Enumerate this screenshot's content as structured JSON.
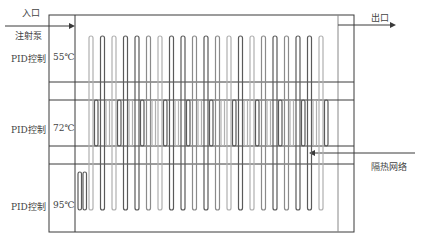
{
  "labels": {
    "inlet": "入口",
    "pump": "注射泵",
    "outlet": "出口",
    "zones": [
      {
        "controller": "PID控制",
        "temp": "55℃"
      },
      {
        "controller": "PID控制",
        "temp": "72℃"
      },
      {
        "controller": "PID控制",
        "temp": "95℃"
      }
    ],
    "insulation": "隔热网络"
  },
  "colors": {
    "line": "#3a3a3a",
    "tube_dark": "#5a5a5a",
    "tube_light": "#b0b0b0"
  },
  "geometry": {
    "tube_count": 21,
    "tube_start_x": 89,
    "tube_spacing": 11.5
  }
}
